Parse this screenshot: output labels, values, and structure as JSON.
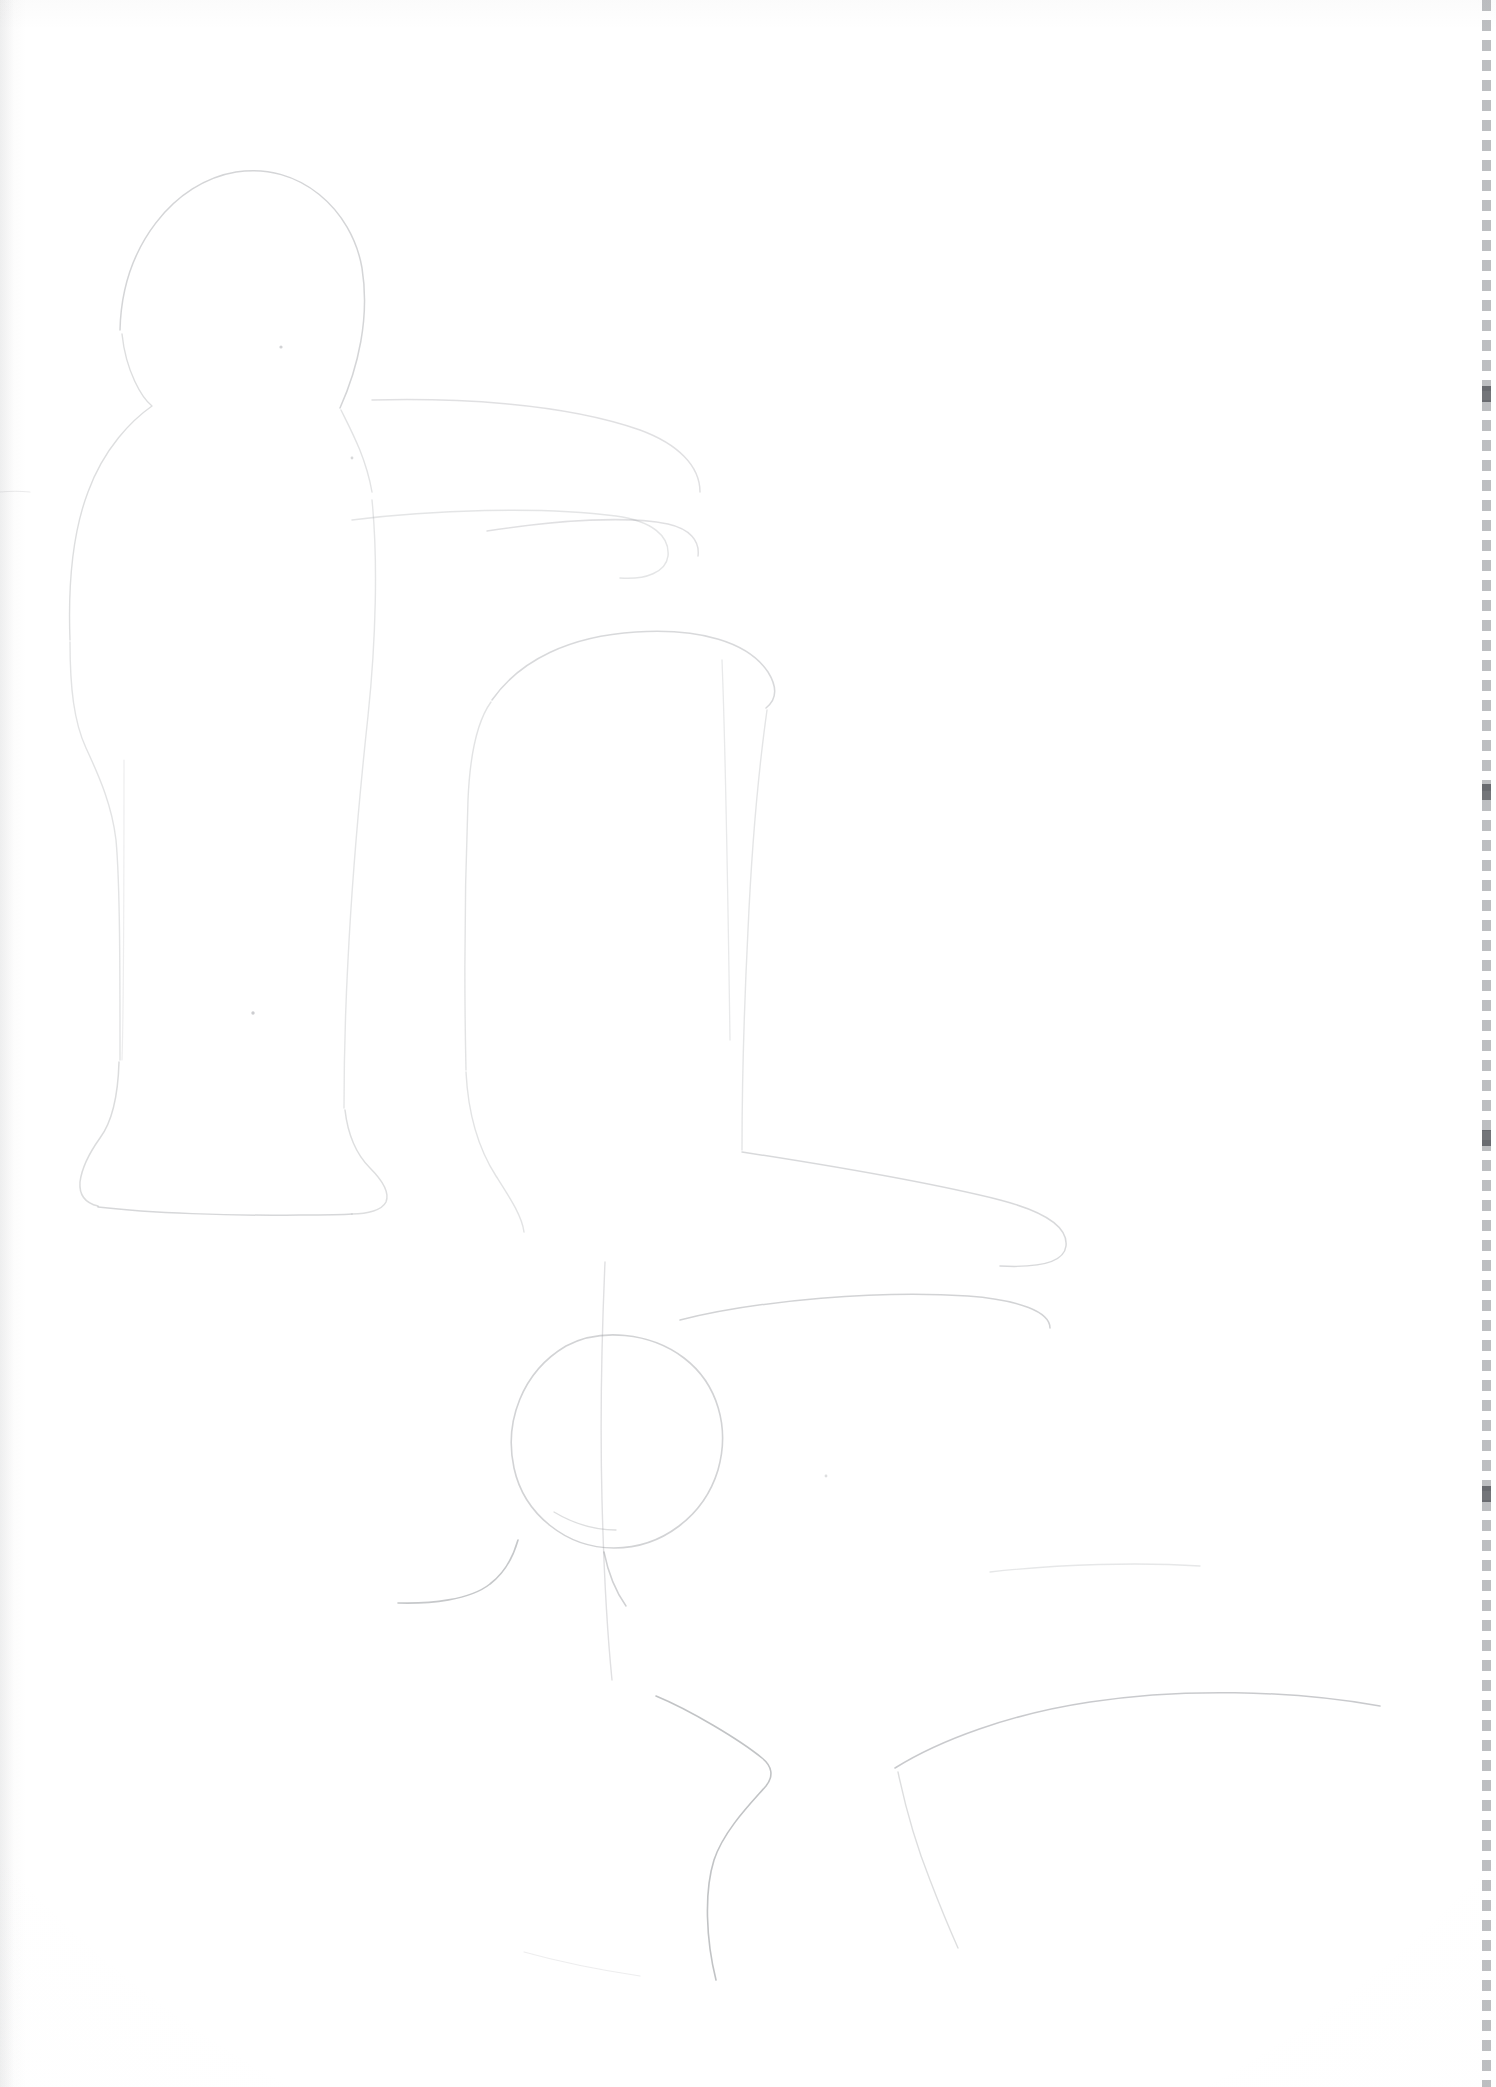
{
  "page": {
    "title": "Scanned pencil line drawing",
    "width": 1496,
    "height": 2087,
    "background_color": "#ffffff",
    "media": "scanned paper sheet",
    "text_content": "",
    "visible_text_present": false
  },
  "palette": {
    "paper": "#ffffff",
    "pencil_line": "#8e9196",
    "faint_line": "#c9ccd0",
    "margin_artifact": "#808388",
    "edge_tone": "#d8dadd"
  },
  "artwork": {
    "description": "Two abstract rounded figures drawn in extremely faint pencil outline on a white sheet, plus a small circle near the lower centre.",
    "stroke_color": "#8e9196",
    "elements": [
      {
        "id": "left-figure-head",
        "label": "rounded dome head outline",
        "opacity": "0.38"
      },
      {
        "id": "left-figure-shoulder",
        "label": "shoulder and neck contour",
        "opacity": "0.30"
      },
      {
        "id": "left-figure-body",
        "label": "tall tapering body column",
        "opacity": "0.26"
      },
      {
        "id": "left-figure-base",
        "label": "flared base / foot",
        "opacity": "0.30"
      },
      {
        "id": "right-figure-arm",
        "label": "long horizontal arm sweep",
        "opacity": "0.26"
      },
      {
        "id": "right-figure-forearm",
        "label": "second horizontal sweep below arm",
        "opacity": "0.24"
      },
      {
        "id": "right-figure-torso",
        "label": "rounded rectangular torso block",
        "opacity": "0.30"
      },
      {
        "id": "right-figure-leg",
        "label": "vertical leg contour",
        "opacity": "0.26"
      },
      {
        "id": "right-figure-foot",
        "label": "long lower base sweep",
        "opacity": "0.34"
      },
      {
        "id": "bottom-circle",
        "label": "circle at lower centre",
        "opacity": "0.40"
      },
      {
        "id": "lower-knee-bend",
        "label": "angular bend contour lower centre",
        "opacity": "0.45"
      }
    ]
  },
  "artifacts": {
    "right_margin": {
      "label": "dashed grey margin marks along right edge",
      "color": "#808388",
      "dash_length_px": 11,
      "gap_length_px": 9,
      "strip_width_px": 9
    },
    "left_edge_tone": {
      "label": "soft grey scan tone along left edge",
      "color": "#8c8f94"
    },
    "heavy_ticks": {
      "label": "darker tick marks on right margin",
      "positions_y": [
        392,
        790,
        1136,
        1492
      ]
    }
  }
}
